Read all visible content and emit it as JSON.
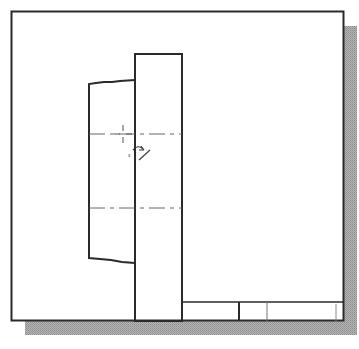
{
  "drawing": {
    "description": "CAD sheet with part views, centerlines and title block",
    "colors": {
      "background": "#ffffff",
      "line": "#2a2a2a",
      "centerline": "#555555",
      "shadow": "#a8a8a8"
    },
    "sheet": {
      "x": 11,
      "y": 11,
      "width": 332,
      "height": 310
    },
    "shadow": {
      "offset_x": 14,
      "offset_y": 15
    },
    "tall_rect": {
      "x": 135,
      "y": 54,
      "width": 47,
      "height": 267
    },
    "side_profile": {
      "points": "135,80 120,81 112,82 104,82 96,83 89,84 89,258 100,259 111,260 122,262 135,263"
    },
    "centerlines": [
      {
        "y": 134,
        "x1": 89,
        "x2": 182
      },
      {
        "y": 208,
        "x1": 89,
        "x2": 182
      }
    ],
    "title_block": {
      "x": 182,
      "y": 302,
      "width": 161,
      "height": 19,
      "dividers": [
        {
          "x": 239,
          "weight": "thick"
        },
        {
          "x": 267,
          "weight": "thin"
        },
        {
          "x": 336,
          "weight": "thin"
        }
      ]
    },
    "cursor": {
      "type": "rotate-cursor",
      "crosshair": {
        "x": 123,
        "y": 134
      },
      "marker_label": "x"
    }
  }
}
